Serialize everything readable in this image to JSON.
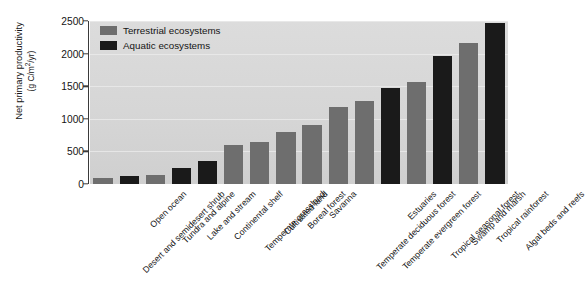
{
  "chart_data": {
    "type": "bar",
    "title": "",
    "xlabel": "",
    "ylabel": "Net primary productivity (g C/m2/yr)",
    "ylabel_line1": "Net primary productivity",
    "ylabel_line2_prefix": "(g C/m",
    "ylabel_line2_sup": "2",
    "ylabel_line2_suffix": "/yr)",
    "ylim": [
      0,
      2500
    ],
    "yticks": [
      0,
      500,
      1000,
      1500,
      2000,
      2500
    ],
    "ytick_labels": [
      "0",
      "500",
      "1000",
      "1500",
      "2000",
      "2500"
    ],
    "grid": true,
    "legend_position": "top-left",
    "categories": [
      "Desert and semidesert shrub",
      "Open ocean",
      "Tundra and alpine",
      "Lake and stream",
      "Continental shelf",
      "Temperate grassland",
      "Cultivated land",
      "Boreal forest",
      "Savanna",
      "Temperate deciduous forest",
      "Temperate evergreen forest",
      "Estuaries",
      "Tropical seasonal forest",
      "Swamp and marsh",
      "Tropical rainforest",
      "Algal beds and reefs"
    ],
    "values": [
      90,
      125,
      140,
      250,
      360,
      600,
      650,
      800,
      900,
      1180,
      1280,
      1470,
      1570,
      1970,
      2170,
      2470
    ],
    "groups": [
      "terrestrial",
      "aquatic",
      "terrestrial",
      "aquatic",
      "aquatic",
      "terrestrial",
      "terrestrial",
      "terrestrial",
      "terrestrial",
      "terrestrial",
      "terrestrial",
      "aquatic",
      "terrestrial",
      "aquatic",
      "terrestrial",
      "aquatic"
    ],
    "series": [
      {
        "name": "Terrestrial ecosystems",
        "color": "#6e6e6e",
        "points": [
          {
            "category": "Desert and semidesert shrub",
            "value": 90
          },
          {
            "category": "Tundra and alpine",
            "value": 140
          },
          {
            "category": "Temperate grassland",
            "value": 600
          },
          {
            "category": "Cultivated land",
            "value": 650
          },
          {
            "category": "Boreal forest",
            "value": 800
          },
          {
            "category": "Savanna",
            "value": 900
          },
          {
            "category": "Temperate deciduous forest",
            "value": 1180
          },
          {
            "category": "Temperate evergreen forest",
            "value": 1280
          },
          {
            "category": "Tropical seasonal forest",
            "value": 1570
          },
          {
            "category": "Tropical rainforest",
            "value": 2170
          }
        ]
      },
      {
        "name": "Aquatic ecosystems",
        "color": "#1a1a1a",
        "points": [
          {
            "category": "Open ocean",
            "value": 125
          },
          {
            "category": "Lake and stream",
            "value": 250
          },
          {
            "category": "Continental shelf",
            "value": 360
          },
          {
            "category": "Estuaries",
            "value": 1470
          },
          {
            "category": "Swamp and marsh",
            "value": 1970
          },
          {
            "category": "Algal beds and reefs",
            "value": 2470
          }
        ]
      }
    ]
  },
  "legend": {
    "items": [
      {
        "label": "Terrestrial ecosystems",
        "color": "#6e6e6e",
        "key": "terrestrial"
      },
      {
        "label": "Aquatic ecosystems",
        "color": "#1a1a1a",
        "key": "aquatic"
      }
    ]
  },
  "colors": {
    "terrestrial": "#6e6e6e",
    "aquatic": "#1a1a1a",
    "plot_background": "#d8d8d8",
    "gridline": "#eaeaea",
    "axis": "#3a3a3a",
    "text": "#141414",
    "page_background": "#ffffff"
  }
}
